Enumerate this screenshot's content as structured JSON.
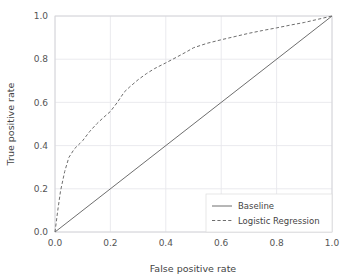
{
  "chart_data": {
    "type": "line",
    "title": "",
    "xlabel": "False positive rate",
    "ylabel": "True positive rate",
    "xlim": [
      0.0,
      1.0
    ],
    "ylim": [
      0.0,
      1.0
    ],
    "xticks": [
      "0.0",
      "0.2",
      "0.4",
      "0.6",
      "0.8",
      "1.0"
    ],
    "yticks": [
      "0.0",
      "0.2",
      "0.4",
      "0.6",
      "0.8",
      "1.0"
    ],
    "xtick_values": [
      0.0,
      0.2,
      0.4,
      0.6,
      0.8,
      1.0
    ],
    "ytick_values": [
      0.0,
      0.2,
      0.4,
      0.6,
      0.8,
      1.0
    ],
    "grid": true,
    "legend_position": "lower right",
    "series": [
      {
        "name": "Baseline",
        "style": "solid",
        "color": "#6e6e6e",
        "x": [
          0.0,
          1.0
        ],
        "y": [
          0.0,
          1.0
        ]
      },
      {
        "name": "Logistic Regression",
        "style": "dashed",
        "color": "#6e6e6e",
        "x": [
          0.0,
          0.01,
          0.02,
          0.035,
          0.05,
          0.07,
          0.09,
          0.1,
          0.125,
          0.15,
          0.175,
          0.2,
          0.225,
          0.25,
          0.27,
          0.3,
          0.33,
          0.36,
          0.4,
          0.44,
          0.48,
          0.5,
          0.55,
          0.6,
          0.65,
          0.7,
          0.75,
          0.8,
          0.85,
          0.9,
          0.95,
          1.0
        ],
        "y": [
          0.0,
          0.1,
          0.19,
          0.28,
          0.345,
          0.385,
          0.41,
          0.423,
          0.465,
          0.5,
          0.53,
          0.558,
          0.6,
          0.648,
          0.672,
          0.705,
          0.733,
          0.757,
          0.783,
          0.81,
          0.838,
          0.853,
          0.874,
          0.89,
          0.905,
          0.92,
          0.933,
          0.945,
          0.958,
          0.97,
          0.985,
          1.0
        ]
      }
    ]
  },
  "legend": {
    "entries": [
      {
        "label": "Baseline",
        "style": "solid"
      },
      {
        "label": "Logistic Regression",
        "style": "dashed"
      }
    ]
  },
  "colors": {
    "grid": "#e8e8ec",
    "axis_border": "#d0d0d4",
    "line": "#6e6e6e",
    "text": "#444444",
    "background": "#ffffff"
  }
}
